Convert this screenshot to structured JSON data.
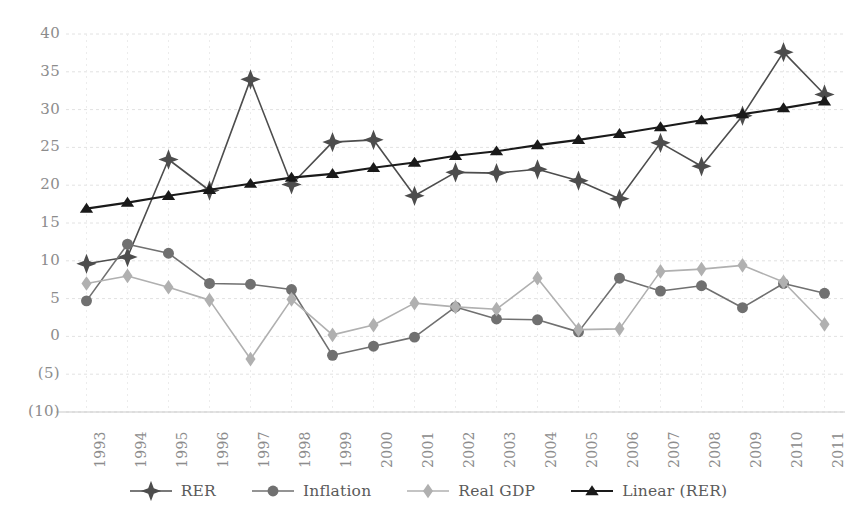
{
  "chart_data": {
    "type": "line",
    "title": "",
    "subtitle": "",
    "xlabel": "",
    "ylabel": "",
    "x": [
      1993,
      1994,
      1995,
      1996,
      1997,
      1998,
      1999,
      2000,
      2001,
      2002,
      2003,
      2004,
      2005,
      2006,
      2007,
      2008,
      2009,
      2010,
      2011
    ],
    "categories": [
      "1993",
      "1994",
      "1995",
      "1996",
      "1997",
      "1998",
      "1999",
      "2000",
      "2001",
      "2002",
      "2003",
      "2004",
      "2005",
      "2006",
      "2007",
      "2008",
      "2009",
      "2010",
      "2011"
    ],
    "ylim": [
      -10,
      40
    ],
    "yticks": [
      40,
      35,
      30,
      25,
      20,
      15,
      10,
      5,
      0,
      -5,
      -10
    ],
    "ytick_labels": [
      "40",
      "35",
      "30",
      "25",
      "20",
      "15",
      "10",
      "5",
      "0",
      "(5)",
      "(10)"
    ],
    "grid": true,
    "legend_position": "bottom",
    "series": [
      {
        "name": "RER",
        "marker": "star",
        "color": "#4d4d4d",
        "values": [
          9.6,
          10.5,
          23.4,
          19.3,
          34.0,
          20.1,
          25.7,
          26.0,
          18.6,
          21.7,
          21.6,
          22.1,
          20.6,
          18.2,
          25.6,
          22.5,
          29.2,
          37.6,
          32.0
        ]
      },
      {
        "name": "Inflation",
        "marker": "circle",
        "color": "#707070",
        "values": [
          4.7,
          12.2,
          11.0,
          7.0,
          6.9,
          6.2,
          -2.5,
          -1.3,
          -0.1,
          3.9,
          2.3,
          2.2,
          0.6,
          7.7,
          6.0,
          6.7,
          3.8,
          7.0,
          5.7
        ]
      },
      {
        "name": "Real GDP",
        "marker": "diamond",
        "color": "#b0b0b0",
        "values": [
          7.0,
          8.0,
          6.5,
          4.8,
          -3.0,
          4.9,
          0.2,
          1.5,
          4.4,
          3.9,
          3.6,
          7.7,
          0.9,
          1.0,
          8.6,
          8.9,
          9.4,
          7.2,
          1.6
        ]
      },
      {
        "name": "Linear (RER)",
        "marker": "triangle",
        "color": "#1a1a1a",
        "values": [
          16.9,
          17.7,
          18.6,
          19.4,
          20.2,
          21.0,
          21.5,
          22.3,
          23.0,
          23.9,
          24.5,
          25.3,
          26.0,
          26.8,
          27.7,
          28.6,
          29.4,
          30.2,
          31.1
        ]
      }
    ]
  },
  "legend": {
    "items": [
      {
        "label": "RER",
        "marker": "star-marker",
        "color": "#4d4d4d"
      },
      {
        "label": "Inflation",
        "marker": "circle-marker",
        "color": "#707070"
      },
      {
        "label": "Real GDP",
        "marker": "diamond-marker",
        "color": "#b0b0b0"
      },
      {
        "label": "Linear (RER)",
        "marker": "triangle-marker",
        "color": "#1a1a1a"
      }
    ]
  }
}
